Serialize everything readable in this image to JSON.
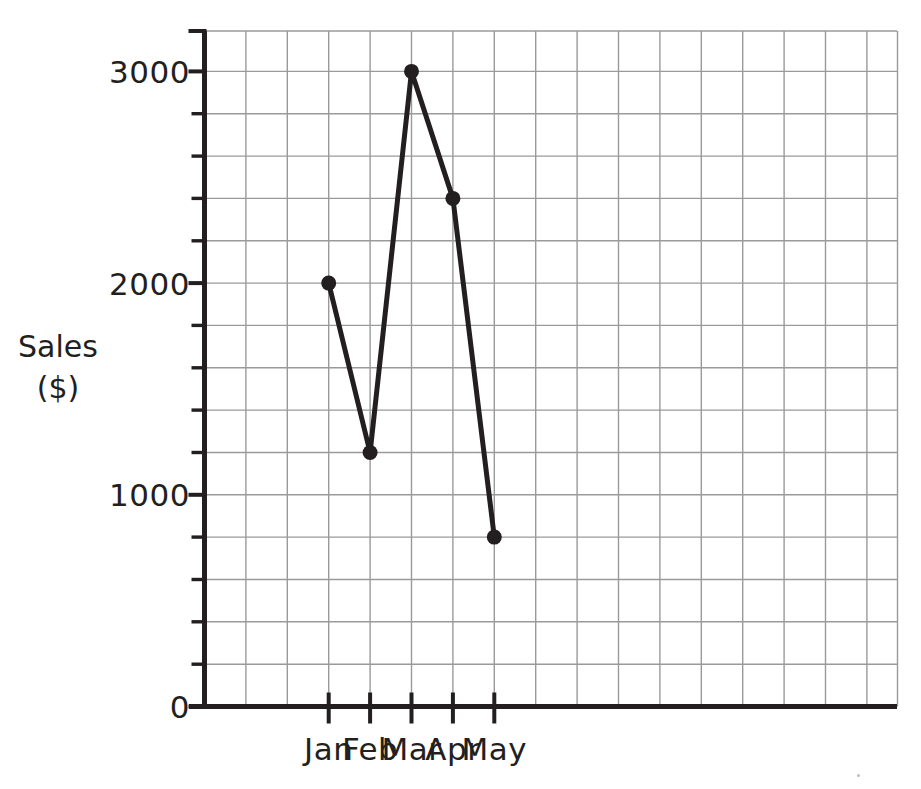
{
  "chart_data": {
    "type": "line",
    "title": "",
    "subtitle": "",
    "xlabel": "",
    "ylabel": "Sales\n($)",
    "ylabel_line1": "Sales",
    "ylabel_line2": "($)",
    "categories": [
      "Jan",
      "Feb",
      "Mar",
      "Apr",
      "May"
    ],
    "values": [
      2000,
      1200,
      3000,
      2400,
      800
    ],
    "series": [
      {
        "name": "Sales",
        "values": [
          2000,
          1200,
          3000,
          2400,
          800
        ]
      }
    ],
    "y_ticks_major": [
      0,
      1000,
      2000,
      3000
    ],
    "y_tick_labels": [
      "0",
      "1000",
      "2000",
      "3000"
    ],
    "y_minor_step": 200,
    "ylim": [
      0,
      3200
    ],
    "xlim_categories_count": 5,
    "grid": true,
    "grid_x_step_value": 200,
    "legend": "none",
    "markers": "filled-circle",
    "line_color": "#231f20",
    "marker_color": "#231f20",
    "grid_color": "#9a9a9a",
    "axis_color": "#231f20",
    "background_color": "#ffffff",
    "annotations": []
  },
  "axes": {
    "y_axis_name": "y-axis",
    "x_axis_name": "x-axis"
  }
}
